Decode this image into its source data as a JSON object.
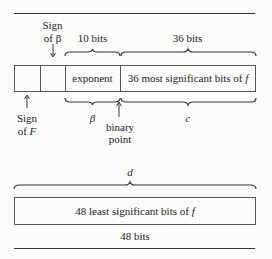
{
  "diagram": {
    "top_word": {
      "sign_beta_label": [
        "Sign",
        "of β"
      ],
      "exponent_width_label": "10 bits",
      "mantissa_width_label": "36 bits",
      "cells": [
        {
          "name": "sign-of-F",
          "text": ""
        },
        {
          "name": "sign-of-beta",
          "text": ""
        },
        {
          "name": "exponent",
          "text": "exponent"
        },
        {
          "name": "msb-f",
          "text": "36 most significant bits of f"
        }
      ],
      "sign_F_label": [
        "Sign",
        "of F"
      ],
      "beta_label": "β",
      "binary_point_label": [
        "binary",
        "point"
      ],
      "c_label": "c"
    },
    "bottom_word": {
      "d_label": "d",
      "cell_text": "48 least significant bits of f",
      "width_label": "48 bits"
    }
  }
}
